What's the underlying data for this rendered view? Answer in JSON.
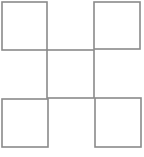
{
  "diagram": {
    "stroke_color": "#8a8a8a",
    "background": "#ffffff",
    "squares": [
      {
        "name": "top-left",
        "x": 2,
        "y": 2,
        "w": 45,
        "h": 48
      },
      {
        "name": "top-right",
        "x": 94,
        "y": 2,
        "w": 46,
        "h": 47
      },
      {
        "name": "bottom-left",
        "x": 2,
        "y": 99,
        "w": 46,
        "h": 48
      },
      {
        "name": "bottom-right",
        "x": 95,
        "y": 98,
        "w": 46,
        "h": 49
      }
    ],
    "center_square": {
      "x": 47,
      "y": 50,
      "w": 47,
      "h": 48
    }
  }
}
